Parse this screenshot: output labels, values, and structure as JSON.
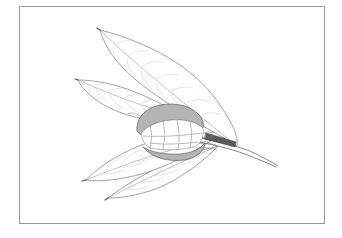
{
  "figure": {
    "style": "grayscale line drawing",
    "frame": {
      "x": 19,
      "y": 6,
      "width": 306,
      "height": 218,
      "border_color": "#9a9a9a"
    },
    "colors": {
      "background": "#ffffff",
      "line": "#8a8a8a",
      "vein": "#b5b5b5",
      "fruit_shell": "#b4b4b4",
      "fruit_shell_outline": "#6e6e6e",
      "stem_band": "#5a5a5a"
    },
    "elements": [
      {
        "name": "upper-leaf",
        "description": "large leaf pointing up-left"
      },
      {
        "name": "middle-left-leaf",
        "description": "leaf pointing left"
      },
      {
        "name": "fruit",
        "description": "opened fruit with gray shell halves and segmented seeds"
      },
      {
        "name": "stem",
        "description": "branch stem extending to the lower right with dark band near fruit"
      },
      {
        "name": "lower-leaf-1",
        "description": "leaf pointing lower-left"
      },
      {
        "name": "lower-leaf-2",
        "description": "leaf pointing lower-left, below the first"
      }
    ]
  }
}
